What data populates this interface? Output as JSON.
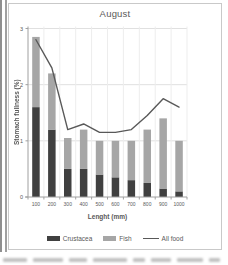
{
  "chart": {
    "title": "August",
    "x_axis_title": "Lenght (mm)",
    "y_axis_title": "Stomach fullness (%)",
    "colors": {
      "text": "#595959",
      "axis": "#a0a0a0",
      "gridline_h": "#e0e0e0",
      "gridline_v": "#ededed",
      "frame_border": "#c9c9c9",
      "crustacea": "#404040",
      "fish": "#a6a6a6",
      "all_food_line": "#595959"
    }
  },
  "chart_data": {
    "type": "bar",
    "subtype": "stacked-bars-with-line-overlay",
    "title": "August",
    "xlabel": "Lenght (mm)",
    "ylabel": "Stomach fullness (%)",
    "categories": [
      "100",
      "200",
      "300",
      "400",
      "500",
      "600",
      "700",
      "800",
      "900",
      "1000"
    ],
    "series": [
      {
        "name": "Crustacea",
        "type": "bar",
        "color": "#404040",
        "values": [
          1.6,
          1.2,
          0.5,
          0.5,
          0.4,
          0.35,
          0.3,
          0.25,
          0.15,
          0.1
        ]
      },
      {
        "name": "Fish",
        "type": "bar",
        "color": "#a6a6a6",
        "values": [
          1.25,
          1.0,
          0.55,
          0.7,
          0.6,
          0.65,
          0.7,
          0.95,
          1.25,
          0.9
        ]
      },
      {
        "name": "All food",
        "type": "line",
        "color": "#595959",
        "values": [
          2.8,
          2.3,
          1.2,
          1.3,
          1.15,
          1.15,
          1.2,
          1.45,
          1.75,
          1.6
        ]
      }
    ],
    "stacked": true,
    "ylim": [
      0,
      3
    ],
    "y_ticks": [
      0,
      1,
      2,
      3
    ],
    "grid": true,
    "legend_position": "bottom"
  }
}
